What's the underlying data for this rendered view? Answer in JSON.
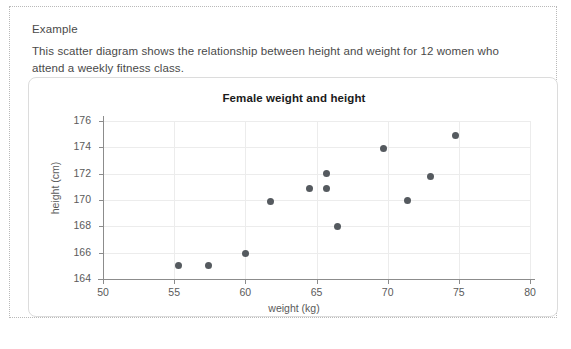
{
  "section": {
    "heading": "Example",
    "body": "This scatter diagram shows the relationship between height and weight for 12 women who attend a weekly fitness class."
  },
  "chart_data": {
    "type": "scatter",
    "title": "Female weight and height",
    "xlabel": "weight (kg)",
    "ylabel": "height (cm)",
    "xlim": [
      50,
      80
    ],
    "ylim": [
      163,
      176.6
    ],
    "xticks": [
      50,
      55,
      60,
      65,
      70,
      75,
      80
    ],
    "yticks": [
      164,
      166,
      168,
      170,
      172,
      174,
      176
    ],
    "grid": true,
    "legend": null,
    "n_points": 12,
    "marker_color": "#555a5f",
    "points": [
      {
        "x": 55.3,
        "y": 165.0
      },
      {
        "x": 57.4,
        "y": 165.0
      },
      {
        "x": 60.0,
        "y": 165.9
      },
      {
        "x": 61.8,
        "y": 169.9
      },
      {
        "x": 64.5,
        "y": 170.9
      },
      {
        "x": 65.7,
        "y": 172.0
      },
      {
        "x": 65.7,
        "y": 170.9
      },
      {
        "x": 66.5,
        "y": 168.0
      },
      {
        "x": 69.7,
        "y": 173.9
      },
      {
        "x": 71.4,
        "y": 170.0
      },
      {
        "x": 73.0,
        "y": 171.8
      },
      {
        "x": 74.8,
        "y": 174.9
      }
    ]
  },
  "colors": {
    "marker": "#555a5f",
    "grid": "#ececec",
    "axis": "#8c8c8c",
    "card_border": "#dcdcdc",
    "text": "#4a4a4a"
  }
}
